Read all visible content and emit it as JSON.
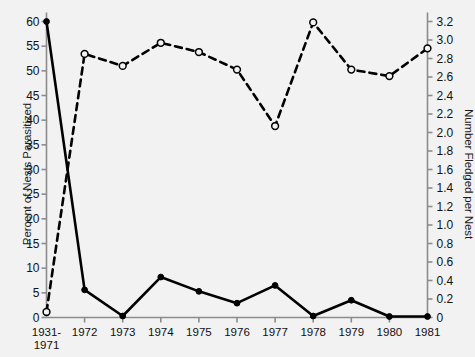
{
  "chart_data": {
    "type": "line",
    "title": "",
    "xlabel": "",
    "categories": [
      "1931-\n1971",
      "1972",
      "1973",
      "1974",
      "1975",
      "1976",
      "1977",
      "1978",
      "1979",
      "1980",
      "1981"
    ],
    "grid": false,
    "legend": "none",
    "series": [
      {
        "name": "Percent of Nests Parasitized",
        "axis": "left",
        "style": "solid",
        "marker": "filled-circle",
        "color": "#000000",
        "values": [
          60.0,
          5.6,
          0.3,
          8.2,
          5.3,
          2.9,
          6.5,
          0.3,
          3.5,
          0.2,
          0.2
        ]
      },
      {
        "name": "Number Fledged per Nest",
        "axis": "right",
        "style": "dashed",
        "marker": "open-circle",
        "color": "#000000",
        "values": [
          0.06,
          2.85,
          2.72,
          2.97,
          2.87,
          2.68,
          2.07,
          3.19,
          2.68,
          2.61,
          2.91
        ]
      }
    ],
    "left_axis": {
      "label": "Percent of Nests Parasitized",
      "ylim": [
        0,
        60
      ],
      "ticks": [
        0,
        5,
        10,
        15,
        20,
        25,
        30,
        35,
        40,
        45,
        50,
        55,
        60
      ],
      "tick_labels": [
        "0",
        "5",
        "10",
        "15",
        "20",
        "25",
        "30",
        "35",
        "40",
        "45",
        "50",
        "55",
        "60"
      ]
    },
    "right_axis": {
      "label": "Number Fledged per Nest",
      "ylim": [
        0,
        3.2
      ],
      "ticks": [
        0,
        0.2,
        0.4,
        0.6,
        0.8,
        1.0,
        1.2,
        1.4,
        1.6,
        1.8,
        2.0,
        2.2,
        2.4,
        2.6,
        2.8,
        3.0,
        3.2
      ],
      "tick_labels": [
        "0",
        "0.2",
        "0.4",
        "0.6",
        "0.8",
        "1.0",
        "1.2",
        "1.4",
        "1.6",
        "1.8",
        "2.0",
        "2.2",
        "2.4",
        "2.6",
        "2.8",
        "3.0",
        "3.2"
      ]
    },
    "x_tick_labels": [
      {
        "line1": "1931-",
        "line2": "1971"
      },
      {
        "line1": "1972",
        "line2": ""
      },
      {
        "line1": "1973",
        "line2": ""
      },
      {
        "line1": "1974",
        "line2": ""
      },
      {
        "line1": "1975",
        "line2": ""
      },
      {
        "line1": "1976",
        "line2": ""
      },
      {
        "line1": "1977",
        "line2": ""
      },
      {
        "line1": "1978",
        "line2": ""
      },
      {
        "line1": "1979",
        "line2": ""
      },
      {
        "line1": "1980",
        "line2": ""
      },
      {
        "line1": "1981",
        "line2": ""
      }
    ],
    "colors": {
      "background": "#f2f2f2",
      "axis": "#8c8c8c",
      "ink": "#000000",
      "text": "#111111"
    }
  }
}
